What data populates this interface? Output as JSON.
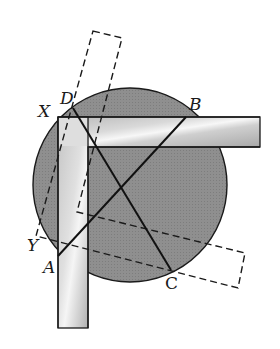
{
  "figure": {
    "colors": {
      "circle_fill": "#8e8e8e",
      "stroke": "#1a1a1a",
      "square_light": "#f2f2f2",
      "square_dark": "#9a9a9a",
      "background": "#ffffff"
    },
    "labels": {
      "A": "A",
      "B": "B",
      "C": "C",
      "D": "D",
      "X": "X",
      "Y": "Y"
    },
    "points": {
      "A": [
        58,
        256
      ],
      "B": [
        186,
        117
      ],
      "C": [
        171,
        270
      ],
      "D": [
        73,
        108
      ],
      "X": [
        52,
        118
      ],
      "Y": [
        36,
        236
      ]
    },
    "circle": {
      "cx": 130,
      "cy": 185,
      "r": 97
    },
    "segments": [
      "AB",
      "DC"
    ]
  }
}
